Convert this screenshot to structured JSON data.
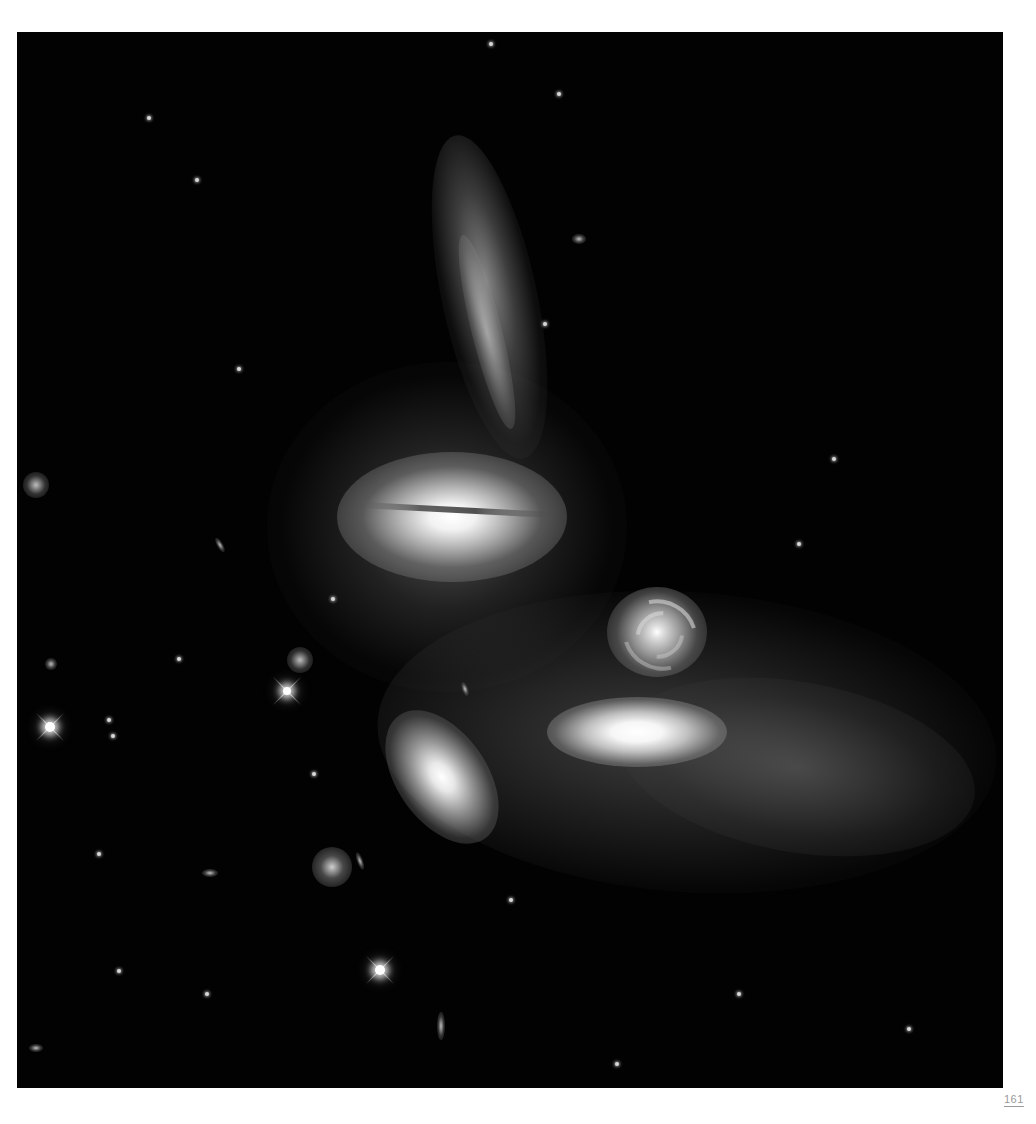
{
  "page": {
    "page_number": "161",
    "background": "#ffffff"
  },
  "photo": {
    "subject": "compact galaxy group in deep space",
    "background_color": "#020202",
    "objects": [
      "edge-on spiral galaxy (top center, vertical)",
      "lenticular galaxy with dust lane (center left)",
      "face-on spiral galaxy (center right)",
      "elongated elliptical galaxy (lower center)",
      "tilted elliptical galaxy (lower left)",
      "diffuse tidal halo (lower right)",
      "foreground stars with diffraction spikes"
    ]
  }
}
